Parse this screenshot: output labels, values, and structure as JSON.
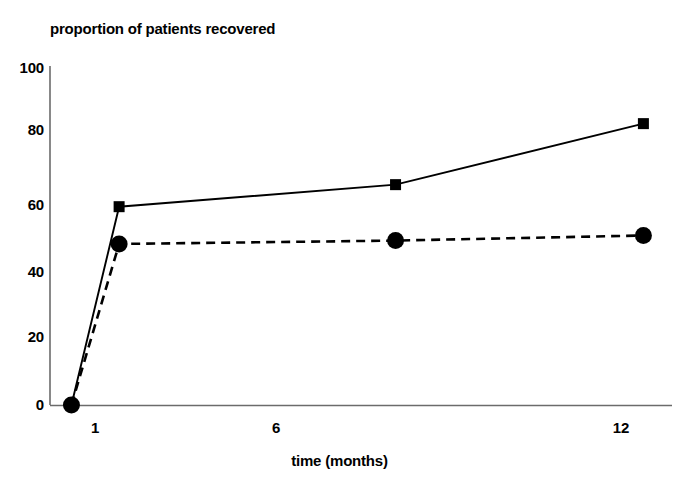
{
  "chart_data": {
    "type": "line",
    "title": "proportion of patients recovered",
    "xlabel": "time (months)",
    "ylabel": "",
    "x": [
      0,
      1,
      6.8,
      12
    ],
    "xtick_values": [
      1,
      6,
      12
    ],
    "xtick_labels": [
      "1",
      "6",
      "12"
    ],
    "ytick_values": [
      0,
      20,
      40,
      60,
      80,
      100
    ],
    "ytick_labels": [
      "0",
      "20",
      "40",
      "60",
      "80",
      "100"
    ],
    "xlim": [
      -0.45,
      12.6
    ],
    "ylim": [
      0,
      100
    ],
    "grid": false,
    "legend": "none",
    "series": [
      {
        "name": "solid-square-series",
        "marker": "square",
        "linestyle": "solid",
        "color": "#000000",
        "x": [
          0,
          1,
          6.8,
          12
        ],
        "values": [
          0,
          58.5,
          65,
          83
        ]
      },
      {
        "name": "dashed-circle-series",
        "marker": "circle",
        "linestyle": "dashed",
        "color": "#000000",
        "x": [
          0,
          1,
          6.8,
          12
        ],
        "values": [
          0,
          47.5,
          48.5,
          50
        ]
      }
    ]
  },
  "axes": {
    "y_axis_label_100": "100",
    "y_axis_label_80": "80",
    "y_axis_label_60": "60",
    "y_axis_label_40": "40",
    "y_axis_label_20": "20",
    "y_axis_label_0": "0",
    "x_axis_label_1": "1",
    "x_axis_label_6": "6",
    "x_axis_label_12": "12"
  },
  "colors": {
    "ink": "#000000",
    "axis": "#6b6b6b",
    "background": "#ffffff"
  }
}
